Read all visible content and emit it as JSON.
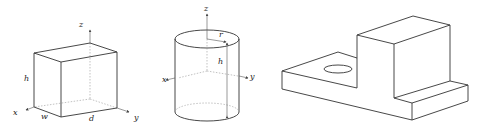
{
  "figures": [
    {
      "name": "box",
      "labels": {
        "z": "z",
        "h": "h",
        "x": "x",
        "w": "w",
        "d": "d",
        "y": "y"
      }
    },
    {
      "name": "cylinder",
      "labels": {
        "z": "z",
        "r": "r",
        "h": "h",
        "x": "x",
        "y": "y"
      }
    },
    {
      "name": "stepped-block-with-hole",
      "labels": {}
    }
  ],
  "colors": {
    "line": "#333333",
    "hidden": "#999999",
    "background": "#ffffff"
  }
}
